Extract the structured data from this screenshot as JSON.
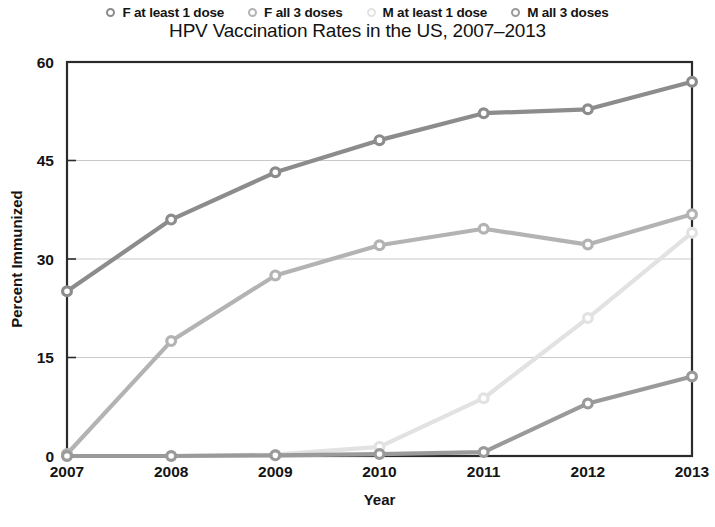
{
  "chart_data": {
    "type": "line",
    "title": "HPV Vaccination Rates in the US, 2007–2013",
    "xlabel": "Year",
    "ylabel": "Percent Immunized",
    "categories": [
      "2007",
      "2008",
      "2009",
      "2010",
      "2011",
      "2012",
      "2013"
    ],
    "x": [
      2007,
      2008,
      2009,
      2010,
      2011,
      2012,
      2013
    ],
    "xlim": [
      2007,
      2013
    ],
    "ylim": [
      0,
      60
    ],
    "yticks": [
      0,
      15,
      30,
      45,
      60
    ],
    "xticks": [
      "2007",
      "2008",
      "2009",
      "2010",
      "2011",
      "2012",
      "2013"
    ],
    "grid": "horizontal",
    "legend_position": "top",
    "marker": "circle-open",
    "series": [
      {
        "name": "F at least 1 dose",
        "color": "#8c8c8c",
        "values": [
          25.1,
          36.0,
          43.2,
          48.1,
          52.2,
          52.8,
          57.0
        ]
      },
      {
        "name": "F all 3 doses",
        "color": "#b3b3b3",
        "values": [
          0.3,
          17.5,
          27.5,
          32.1,
          34.6,
          32.2,
          36.8
        ]
      },
      {
        "name": "M at least 1 dose",
        "color": "#e2e2e2",
        "values": [
          0.0,
          0.0,
          0.2,
          1.4,
          8.8,
          21.0,
          34.0
        ]
      },
      {
        "name": "M all 3 doses",
        "color": "#9a9a9a",
        "values": [
          0.0,
          0.0,
          0.1,
          0.3,
          0.6,
          8.0,
          12.1
        ]
      }
    ]
  },
  "legend": {
    "items": [
      {
        "label": "F at least 1 dose",
        "color": "#8c8c8c"
      },
      {
        "label": "F all 3 doses",
        "color": "#b3b3b3"
      },
      {
        "label": "M at least 1 dose",
        "color": "#e2e2e2"
      },
      {
        "label": "M all 3 doses",
        "color": "#9a9a9a"
      }
    ]
  },
  "axes": {
    "y_label": "Percent Immunized",
    "x_label": "Year",
    "y_ticks": [
      "60",
      "45",
      "30",
      "15",
      "0"
    ],
    "x_ticks": [
      "2007",
      "2008",
      "2009",
      "2010",
      "2011",
      "2012",
      "2013"
    ]
  },
  "colors": {
    "frame": "#2b2b2b",
    "grid": "#c9c9c9",
    "background": "#ffffff",
    "text": "#141414"
  }
}
